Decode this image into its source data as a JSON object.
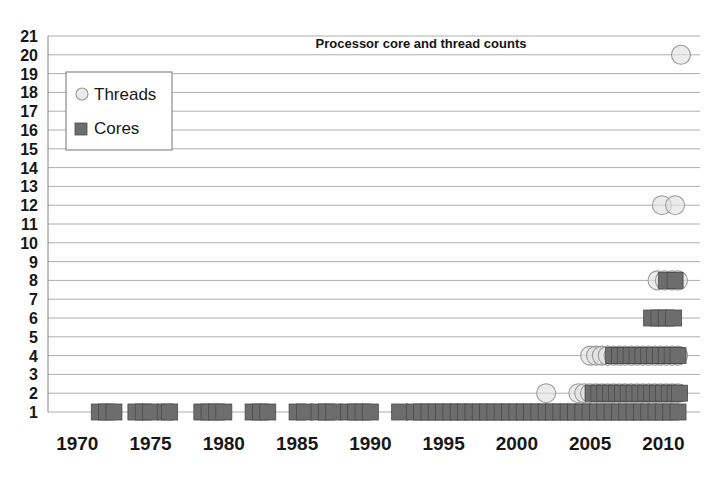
{
  "chart_data": {
    "type": "scatter",
    "title": "Processor core and thread counts",
    "xlabel": "",
    "ylabel": "",
    "xlim": [
      1968,
      2012.5
    ],
    "ylim": [
      1,
      21
    ],
    "grid": true,
    "legend_position": "top-left",
    "x_ticks": [
      1970,
      1975,
      1980,
      1985,
      1990,
      1995,
      2000,
      2005,
      2010
    ],
    "y_ticks": [
      1,
      2,
      3,
      4,
      5,
      6,
      7,
      8,
      9,
      10,
      11,
      12,
      13,
      14,
      15,
      16,
      17,
      18,
      19,
      20,
      21
    ],
    "series": [
      {
        "name": "Threads",
        "marker": "circle",
        "color": "#e2e2e2",
        "edge_color": "#9a9a9a",
        "points": [
          [
            2002.0,
            2
          ],
          [
            2004.2,
            2
          ],
          [
            2004.6,
            2
          ],
          [
            2005.0,
            2
          ],
          [
            2005.4,
            2
          ],
          [
            2005.8,
            2
          ],
          [
            2006.2,
            2
          ],
          [
            2006.6,
            2
          ],
          [
            2007.0,
            2
          ],
          [
            2007.4,
            2
          ],
          [
            2007.8,
            2
          ],
          [
            2008.2,
            2
          ],
          [
            2008.6,
            2
          ],
          [
            2009.0,
            2
          ],
          [
            2009.4,
            2
          ],
          [
            2009.8,
            2
          ],
          [
            2010.2,
            2
          ],
          [
            2010.6,
            2
          ],
          [
            2011.0,
            2
          ],
          [
            2005.0,
            4
          ],
          [
            2005.4,
            4
          ],
          [
            2005.8,
            4
          ],
          [
            2006.2,
            4
          ],
          [
            2006.6,
            4
          ],
          [
            2007.0,
            4
          ],
          [
            2007.4,
            4
          ],
          [
            2007.8,
            4
          ],
          [
            2008.2,
            4
          ],
          [
            2008.6,
            4
          ],
          [
            2009.0,
            4
          ],
          [
            2009.4,
            4
          ],
          [
            2009.8,
            4
          ],
          [
            2010.2,
            4
          ],
          [
            2010.6,
            4
          ],
          [
            2011.0,
            4
          ],
          [
            2009.6,
            8
          ],
          [
            2010.1,
            8
          ],
          [
            2010.6,
            8
          ],
          [
            2011.0,
            8
          ],
          [
            2009.9,
            12
          ],
          [
            2010.8,
            12
          ],
          [
            2011.2,
            20
          ]
        ]
      },
      {
        "name": "Cores",
        "marker": "square",
        "color": "#6d6d6d",
        "edge_color": "#4a4a4a",
        "points": [
          [
            1971.5,
            1
          ],
          [
            1972.0,
            1
          ],
          [
            1972.5,
            1
          ],
          [
            1974.0,
            1
          ],
          [
            1974.5,
            1
          ],
          [
            1975.0,
            1
          ],
          [
            1976.0,
            1
          ],
          [
            1976.3,
            1
          ],
          [
            1978.5,
            1
          ],
          [
            1979.0,
            1
          ],
          [
            1979.5,
            1
          ],
          [
            1980.0,
            1
          ],
          [
            1982.0,
            1
          ],
          [
            1982.5,
            1
          ],
          [
            1983.0,
            1
          ],
          [
            1985.0,
            1
          ],
          [
            1985.5,
            1
          ],
          [
            1986.5,
            1
          ],
          [
            1987.0,
            1
          ],
          [
            1987.5,
            1
          ],
          [
            1988.5,
            1
          ],
          [
            1989.0,
            1
          ],
          [
            1989.5,
            1
          ],
          [
            1990.0,
            1
          ],
          [
            1992.0,
            1
          ],
          [
            1993.0,
            1
          ],
          [
            1993.5,
            1
          ],
          [
            1994.0,
            1
          ],
          [
            1994.5,
            1
          ],
          [
            1995.0,
            1
          ],
          [
            1995.5,
            1
          ],
          [
            1996.0,
            1
          ],
          [
            1996.5,
            1
          ],
          [
            1997.0,
            1
          ],
          [
            1997.5,
            1
          ],
          [
            1998.0,
            1
          ],
          [
            1998.5,
            1
          ],
          [
            1999.0,
            1
          ],
          [
            1999.5,
            1
          ],
          [
            2000.0,
            1
          ],
          [
            2000.5,
            1
          ],
          [
            2001.0,
            1
          ],
          [
            2001.5,
            1
          ],
          [
            2002.0,
            1
          ],
          [
            2002.5,
            1
          ],
          [
            2003.0,
            1
          ],
          [
            2003.5,
            1
          ],
          [
            2004.0,
            1
          ],
          [
            2004.5,
            1
          ],
          [
            2005.0,
            1
          ],
          [
            2005.5,
            1
          ],
          [
            2006.0,
            1
          ],
          [
            2006.5,
            1
          ],
          [
            2007.0,
            1
          ],
          [
            2007.5,
            1
          ],
          [
            2008.0,
            1
          ],
          [
            2008.5,
            1
          ],
          [
            2009.0,
            1
          ],
          [
            2009.5,
            1
          ],
          [
            2010.0,
            1
          ],
          [
            2010.5,
            1
          ],
          [
            2011.0,
            1
          ],
          [
            2005.2,
            2
          ],
          [
            2005.6,
            2
          ],
          [
            2006.0,
            2
          ],
          [
            2006.4,
            2
          ],
          [
            2006.8,
            2
          ],
          [
            2007.2,
            2
          ],
          [
            2007.6,
            2
          ],
          [
            2008.0,
            2
          ],
          [
            2008.4,
            2
          ],
          [
            2008.8,
            2
          ],
          [
            2009.2,
            2
          ],
          [
            2009.6,
            2
          ],
          [
            2010.0,
            2
          ],
          [
            2010.4,
            2
          ],
          [
            2010.8,
            2
          ],
          [
            2011.1,
            2
          ],
          [
            2006.6,
            4
          ],
          [
            2007.0,
            4
          ],
          [
            2007.4,
            4
          ],
          [
            2007.8,
            4
          ],
          [
            2008.2,
            4
          ],
          [
            2008.6,
            4
          ],
          [
            2009.0,
            4
          ],
          [
            2009.4,
            4
          ],
          [
            2009.8,
            4
          ],
          [
            2010.2,
            4
          ],
          [
            2010.6,
            4
          ],
          [
            2011.0,
            4
          ],
          [
            2009.2,
            6
          ],
          [
            2009.7,
            6
          ],
          [
            2010.2,
            6
          ],
          [
            2010.7,
            6
          ],
          [
            2010.2,
            8
          ],
          [
            2010.8,
            8
          ]
        ]
      }
    ]
  },
  "legend": {
    "items": [
      {
        "label": "Threads",
        "marker": "circle"
      },
      {
        "label": "Cores",
        "marker": "square"
      }
    ]
  }
}
